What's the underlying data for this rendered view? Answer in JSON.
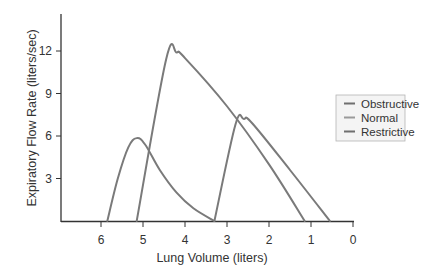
{
  "chart_data": {
    "type": "line",
    "title": "",
    "xlabel": "Lung Volume (liters)",
    "ylabel": "Expiratory Flow Rate (liters/sec)",
    "xlim": [
      6.5,
      0
    ],
    "ylim": [
      0,
      14.5
    ],
    "x_reversed": true,
    "x_ticks": [
      6,
      5,
      4,
      3,
      2,
      1,
      0
    ],
    "y_ticks": [
      3,
      6,
      9,
      12
    ],
    "grid": false,
    "legend_position": "right",
    "series": [
      {
        "name": "Obstructive",
        "color": "#7a7a7a",
        "x": [
          5.85,
          5.6,
          5.35,
          5.15,
          4.95,
          4.6,
          4.2,
          3.8,
          3.3
        ],
        "y": [
          0,
          3.0,
          5.2,
          5.85,
          5.4,
          3.6,
          2.0,
          0.9,
          0
        ]
      },
      {
        "name": "Normal",
        "color": "#7a7a7a",
        "x": [
          5.15,
          4.45,
          4.2,
          4.0,
          3.0,
          2.0,
          1.15
        ],
        "y": [
          0,
          11.4,
          11.9,
          11.5,
          8.1,
          4.0,
          0
        ]
      },
      {
        "name": "Restrictive",
        "color": "#7a7a7a",
        "x": [
          3.3,
          2.8,
          2.6,
          2.4,
          1.5,
          0.55
        ],
        "y": [
          0,
          6.8,
          7.2,
          6.9,
          3.6,
          0
        ]
      }
    ]
  },
  "axes": {
    "x_label": "Lung Volume (liters)",
    "y_label": "Expiratory Flow Rate (liters/sec)",
    "x_tick_labels": [
      "6",
      "5",
      "4",
      "3",
      "2",
      "1",
      "0"
    ],
    "y_tick_labels": [
      "3",
      "6",
      "9",
      "12"
    ]
  },
  "legend": {
    "items": [
      "Obstructive",
      "Normal",
      "Restrictive"
    ]
  },
  "colors": {
    "curve": "#7a7a7a",
    "axis": "#333333",
    "legend_border": "#b5b5b5",
    "legend_bg": "#f4f4f4"
  }
}
